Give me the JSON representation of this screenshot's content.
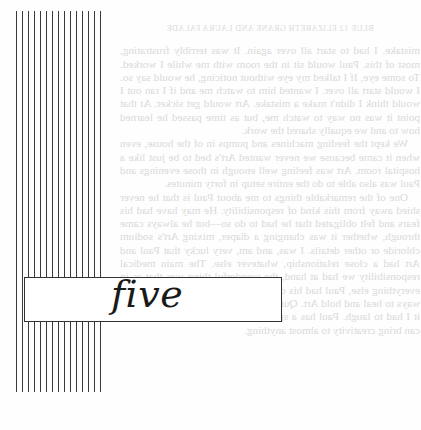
{
  "page": {
    "type": "scanned book page",
    "chapter": {
      "title": "five"
    },
    "bleed_through": {
      "running_head": "BLUE 12   ELIZABETH GRANE AND LAURA FALADE",
      "paragraphs": [
        "mistake. I had to start all over again. It was terribly frustrating, most of this. Paul would sit in the room with me while I worked. To some eye, If I talked my eye without noticing, he would say so. I would start all over. I wanted him to watch me and if I ran out I would think I didn't make a mistake. Art would get sicker. At that point it was no way to watch me, but as time passed he learned how to and we equally shared the work.",
        "We kept the feeding machines and pumps in of the house, even when it came because we never wanted Art's bed to be just like a hospital room. Art was feeling well enough in those evenings and Paul was also able to do the entire setup in forty minutes.",
        "One of the remarkable things to me about Paul is that he never shied away from this kind of responsibility. He may have had his fears and felt obligated that he had to do so—but he always came through, whether it was changing a diaper, mixing Art's sodium chloride or other details. I was, and am, very lucky that Paul and Art had a close relationship, whatever else. The main medical responsibility we had at hand, the wonderful thing was that as in everything else, Paul had his own style. He would create amazing ways to heal and hold Art. Quips in one hand. The first time I saw it I had to laugh. Paul has a special way of teaching me how one can bring creativity to almost anything."
      ]
    }
  }
}
